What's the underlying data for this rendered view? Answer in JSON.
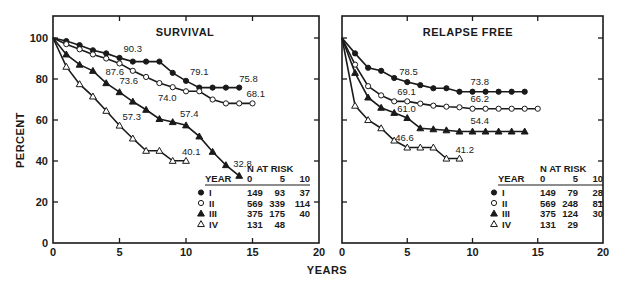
{
  "chart_data": [
    {
      "type": "line",
      "title": "SURVIVAL",
      "xlabel": "YEARS",
      "ylabel": "PERCENT",
      "xlim": [
        0,
        20
      ],
      "ylim": [
        0,
        100
      ],
      "xticks": [
        0,
        5,
        10,
        15,
        20
      ],
      "yticks": [
        0,
        20,
        40,
        60,
        80,
        100
      ],
      "grid": false,
      "series": [
        {
          "name": "I",
          "marker": "filled-circle",
          "x": [
            0,
            1,
            2,
            3,
            4,
            5,
            6,
            7,
            8,
            9,
            10,
            11,
            12,
            13,
            14
          ],
          "values": [
            100,
            98.5,
            96.5,
            94,
            92.5,
            90.3,
            88.5,
            88.5,
            88.5,
            83,
            79.1,
            75.8,
            75.8,
            75.8,
            75.8
          ]
        },
        {
          "name": "II",
          "marker": "open-circle",
          "x": [
            0,
            1,
            2,
            3,
            4,
            5,
            6,
            7,
            8,
            9,
            10,
            11,
            12,
            13,
            14,
            15
          ],
          "values": [
            100,
            97,
            94.5,
            92,
            90,
            87.6,
            84,
            81,
            78,
            76,
            74.0,
            74.0,
            70,
            68.1,
            68.1,
            68.1
          ]
        },
        {
          "name": "III",
          "marker": "filled-triangle",
          "x": [
            0,
            1,
            2,
            3,
            4,
            5,
            6,
            7,
            8,
            9,
            10,
            11,
            12,
            13,
            14
          ],
          "values": [
            100,
            92,
            87,
            84,
            78,
            73.6,
            69,
            65,
            60.5,
            59,
            57.4,
            52,
            44.5,
            38,
            32.8
          ]
        },
        {
          "name": "IV",
          "marker": "open-triangle",
          "x": [
            0,
            1,
            2,
            3,
            4,
            5,
            6,
            7,
            8,
            9,
            10
          ],
          "values": [
            100,
            86,
            77.5,
            71.5,
            64.5,
            57.3,
            51,
            45,
            45,
            40.1,
            40.1
          ]
        }
      ],
      "annotations": [
        {
          "text": "90.3",
          "series": "I",
          "x": 5
        },
        {
          "text": "79.1",
          "series": "I",
          "x": 10
        },
        {
          "text": "75.8",
          "series": "I",
          "x": 14
        },
        {
          "text": "87.6",
          "series": "II",
          "x": 5
        },
        {
          "text": "74.0",
          "series": "II",
          "x": 10
        },
        {
          "text": "68.1",
          "series": "II",
          "x": 15
        },
        {
          "text": "73.6",
          "series": "III",
          "x": 5
        },
        {
          "text": "57.4",
          "series": "III",
          "x": 10
        },
        {
          "text": "32.8",
          "series": "III",
          "x": 14
        },
        {
          "text": "57.3",
          "series": "IV",
          "x": 5
        },
        {
          "text": "40.1",
          "series": "IV",
          "x": 10
        }
      ],
      "at_risk_table": {
        "title": "N AT RISK",
        "header": [
          "YEAR",
          "0",
          "5",
          "10"
        ],
        "rows": [
          {
            "stage": "I",
            "marker": "filled-circle",
            "values": [
              "149",
              "93",
              "37"
            ]
          },
          {
            "stage": "II",
            "marker": "open-circle",
            "values": [
              "569",
              "339",
              "114"
            ]
          },
          {
            "stage": "III",
            "marker": "filled-triangle",
            "values": [
              "375",
              "175",
              "40"
            ]
          },
          {
            "stage": "IV",
            "marker": "open-triangle",
            "values": [
              "131",
              "48",
              ""
            ]
          }
        ]
      }
    },
    {
      "type": "line",
      "title": "RELAPSE FREE",
      "xlabel": "YEARS",
      "ylabel": "PERCENT",
      "xlim": [
        0,
        20
      ],
      "ylim": [
        0,
        100
      ],
      "xticks": [
        0,
        5,
        10,
        15,
        20
      ],
      "yticks": [
        0,
        20,
        40,
        60,
        80,
        100
      ],
      "grid": false,
      "series": [
        {
          "name": "I",
          "marker": "filled-circle",
          "x": [
            0,
            1,
            2,
            3,
            4,
            5,
            6,
            7,
            8,
            9,
            10,
            11,
            12,
            13,
            14
          ],
          "values": [
            100,
            92.5,
            85.5,
            84,
            80.5,
            78.5,
            77,
            75.5,
            75.5,
            73.8,
            73.8,
            73.8,
            73.8,
            73.8,
            73.8
          ]
        },
        {
          "name": "II",
          "marker": "open-circle",
          "x": [
            0,
            1,
            2,
            3,
            4,
            5,
            6,
            7,
            8,
            9,
            10,
            11,
            12,
            13,
            14,
            15
          ],
          "values": [
            100,
            87,
            76.5,
            72,
            69.1,
            69.1,
            68,
            67,
            66.5,
            66.2,
            65.5,
            65.5,
            65.5,
            65.5,
            65.5,
            65.5
          ]
        },
        {
          "name": "III",
          "marker": "filled-triangle",
          "x": [
            0,
            1,
            2,
            3,
            4,
            5,
            6,
            7,
            8,
            9,
            10,
            11,
            12,
            13,
            14
          ],
          "values": [
            100,
            83,
            71,
            66,
            63.5,
            61.0,
            56,
            55.5,
            55,
            54.4,
            54.4,
            54.4,
            54.4,
            54.4,
            54.4
          ]
        },
        {
          "name": "IV",
          "marker": "open-triangle",
          "x": [
            0,
            1,
            2,
            3,
            4,
            5,
            6,
            7,
            8,
            9
          ],
          "values": [
            100,
            67,
            60,
            56,
            50,
            46.6,
            46.6,
            46.6,
            41.2,
            41.2
          ]
        }
      ],
      "annotations": [
        {
          "text": "78.5",
          "series": "I",
          "x": 5
        },
        {
          "text": "73.8",
          "series": "I",
          "x": 10
        },
        {
          "text": "69.1",
          "series": "II",
          "x": 5
        },
        {
          "text": "66.2",
          "series": "II",
          "x": 10
        },
        {
          "text": "61.0",
          "series": "III",
          "x": 5
        },
        {
          "text": "54.4",
          "series": "III",
          "x": 10
        },
        {
          "text": "46.6",
          "series": "IV",
          "x": 5
        },
        {
          "text": "41.2",
          "series": "IV",
          "x": 9
        }
      ],
      "at_risk_table": {
        "title": "N AT RISK",
        "header": [
          "YEAR",
          "0",
          "5",
          "10"
        ],
        "rows": [
          {
            "stage": "I",
            "marker": "filled-circle",
            "values": [
              "149",
              "79",
              "28"
            ]
          },
          {
            "stage": "II",
            "marker": "open-circle",
            "values": [
              "569",
              "248",
              "81"
            ]
          },
          {
            "stage": "III",
            "marker": "filled-triangle",
            "values": [
              "375",
              "124",
              "30"
            ]
          },
          {
            "stage": "IV",
            "marker": "open-triangle",
            "values": [
              "131",
              "29",
              ""
            ]
          }
        ]
      }
    }
  ],
  "labels": {
    "ylabel": "PERCENT",
    "xlabel": "YEARS"
  },
  "colors": {
    "ink": "#1a1a1a",
    "background": "#ffffff"
  }
}
